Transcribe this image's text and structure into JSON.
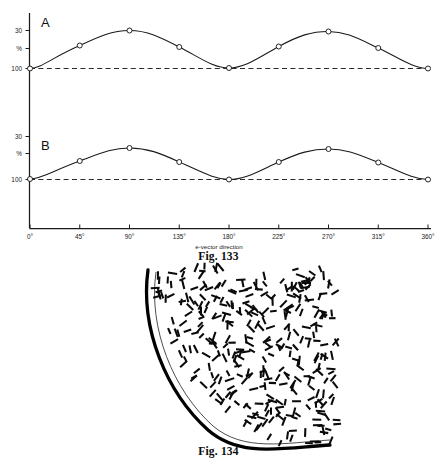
{
  "figures": [
    {
      "id": "fig-133",
      "caption": "Fig. 133",
      "axis": {
        "xlabel": "e-vector direction",
        "xticks": [
          "0°",
          "45°",
          "90°",
          "135°",
          "180°",
          "225°",
          "270°",
          "315°",
          "360°"
        ],
        "yticks": [
          "30",
          "%",
          "100"
        ]
      },
      "panels": [
        {
          "letter": "A"
        },
        {
          "letter": "B"
        }
      ]
    },
    {
      "id": "fig-134",
      "caption": "Fig. 134"
    }
  ],
  "colors": {
    "ink": "#111111",
    "curve": "#1a1a1a",
    "dashed_baseline": "#2b2b2b",
    "marker_fill": "#ffffff",
    "arc": "#000000",
    "background": "#ffffff"
  },
  "chart_data": {
    "type": "line",
    "title": "Fig. 133",
    "subtitle": "Relative response (%) as a function of e-vector direction, two units A and B",
    "xlabel": "e-vector direction",
    "ylabel": "%",
    "xticklabels": [
      "0°",
      "45°",
      "90°",
      "135°",
      "180°",
      "225°",
      "270°",
      "315°",
      "360°"
    ],
    "x": [
      0,
      45,
      90,
      135,
      180,
      225,
      270,
      315,
      360
    ],
    "yticklabels": [
      "100",
      "%",
      "30"
    ],
    "yticks": [
      100,
      115,
      130
    ],
    "ylim": [
      98,
      134
    ],
    "grid": false,
    "legend": null,
    "annotations": [
      "A",
      "B"
    ],
    "baseline": {
      "value": 100,
      "style": "dashed",
      "label": "100"
    },
    "series": [
      {
        "name": "A",
        "panel": "A",
        "marker": "open-circle",
        "values": [
          100,
          119,
          130,
          118,
          100.5,
          118,
          129.5,
          117,
          100
        ]
      },
      {
        "name": "B",
        "panel": "B",
        "marker": "open-circle",
        "values": [
          100,
          115,
          125,
          114,
          100,
          114,
          124.5,
          114,
          100
        ]
      }
    ]
  },
  "fig134_data": {
    "type": "schematic",
    "description": "Quarter-circle outline (thick arc, lower-left) filled with short dashes representing microvillar orientation; dashes near the arc follow radial/tangential order, becoming irregular toward the upper right.",
    "arc_stroke_width": 3.2,
    "dash_count": 430
  }
}
